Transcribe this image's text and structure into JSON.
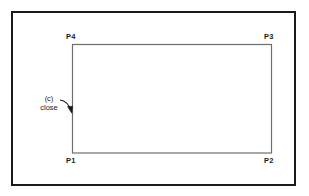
{
  "figure": {
    "caption_tag": "(c)",
    "operation_label": "close",
    "vertices": [
      {
        "name": "P4",
        "label": "P4",
        "position": "top-left"
      },
      {
        "name": "P3",
        "label": "P3",
        "position": "top-right"
      },
      {
        "name": "P1",
        "label": "P1",
        "position": "bottom-left"
      },
      {
        "name": "P2",
        "label": "P2",
        "position": "bottom-right"
      }
    ],
    "shape": {
      "type": "rectangle",
      "closed": true,
      "stroke_color": "#6e6e6e",
      "fill_color": "#ffffff"
    },
    "frame": {
      "stroke_color": "#1a1a1a"
    },
    "pointer": {
      "name": "curved-arrow",
      "target_edge": "left",
      "stroke_color": "#1a1a1a"
    }
  }
}
